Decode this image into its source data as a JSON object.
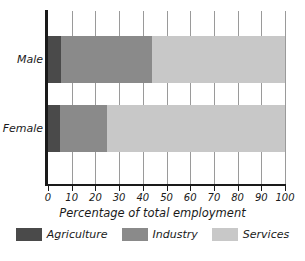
{
  "chart_data": {
    "type": "bar",
    "orientation": "horizontal",
    "stacked": true,
    "title": "",
    "xlabel": "Percentage of total employment",
    "ylabel": "",
    "xlim": [
      0,
      100
    ],
    "xticks": [
      0,
      10,
      20,
      30,
      40,
      50,
      60,
      70,
      80,
      90,
      100
    ],
    "xtick_labels": [
      "0",
      "10",
      "20",
      "30",
      "40",
      "50",
      "60",
      "70",
      "80",
      "90",
      "100"
    ],
    "grid": true,
    "grid_axis": "x",
    "legend_position": "bottom",
    "categories": [
      "Male",
      "Female"
    ],
    "series": [
      {
        "name": "Agriculture",
        "color": "#4a4a4a",
        "values": [
          5.5,
          5.0
        ]
      },
      {
        "name": "Industry",
        "color": "#8a8a8a",
        "values": [
          38.5,
          20.0
        ]
      },
      {
        "name": "Services",
        "color": "#c8c8c8",
        "values": [
          56.0,
          75.0
        ]
      }
    ],
    "cumulative_boundaries": {
      "Male": [
        5.5,
        44.0,
        100.0
      ],
      "Female": [
        5.0,
        25.0,
        100.0
      ]
    }
  },
  "axis": {
    "x_title": "Percentage of total employment",
    "ticks": [
      "0",
      "10",
      "20",
      "30",
      "40",
      "50",
      "60",
      "70",
      "80",
      "90",
      "100"
    ]
  },
  "categories": [
    {
      "label": "Male"
    },
    {
      "label": "Female"
    }
  ],
  "legend": {
    "items": [
      {
        "label": "Agriculture",
        "color": "#4a4a4a"
      },
      {
        "label": "Industry",
        "color": "#8a8a8a"
      },
      {
        "label": "Services",
        "color": "#c8c8c8"
      }
    ]
  },
  "colors": {
    "agriculture": "#4a4a4a",
    "industry": "#8a8a8a",
    "services": "#c8c8c8",
    "axis": "#1a1a1a",
    "grid": "#9a9a9a",
    "background": "#ffffff"
  }
}
